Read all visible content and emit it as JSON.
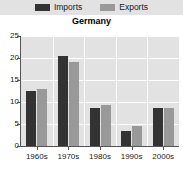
{
  "chart_data": {
    "type": "bar",
    "title": "Germany",
    "xlabel": "",
    "ylabel": "",
    "categories": [
      "1960s",
      "1970s",
      "1980s",
      "1990s",
      "2000s"
    ],
    "series": [
      {
        "name": "Imports",
        "color": "#333333",
        "values": [
          12.5,
          20.5,
          8.7,
          3.5,
          8.7
        ]
      },
      {
        "name": "Exports",
        "color": "#999999",
        "values": [
          13.0,
          19.2,
          9.3,
          4.6,
          8.7
        ]
      }
    ],
    "ylim": [
      0,
      25
    ],
    "yticks": [
      0,
      5,
      10,
      15,
      20,
      25
    ],
    "ytick_labels": [
      "0",
      "5",
      "10",
      "15",
      "20",
      "25"
    ],
    "grid": true,
    "legend_position": "top",
    "plot_background": "#e2e2e2",
    "gridline_color": "#ffffff",
    "axis_color": "#555555"
  },
  "legend": {
    "items": [
      {
        "label": "Imports",
        "color": "#333333"
      },
      {
        "label": "Exports",
        "color": "#999999"
      }
    ]
  }
}
